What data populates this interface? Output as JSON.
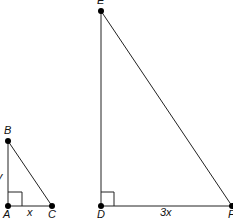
{
  "diagram": {
    "type": "similar-right-triangles",
    "triangles": [
      {
        "name": "ABC",
        "vertices": {
          "A": {
            "label": "A",
            "x": 8,
            "y": 206
          },
          "B": {
            "label": "B",
            "x": 8,
            "y": 141
          },
          "C": {
            "label": "C",
            "x": 52,
            "y": 206
          }
        },
        "right_angle_at": "A",
        "side_labels": {
          "AB": "y",
          "AC": "x"
        }
      },
      {
        "name": "DEF",
        "vertices": {
          "D": {
            "label": "D",
            "x": 101,
            "y": 206
          },
          "E": {
            "label": "E",
            "x": 101,
            "y": 11
          },
          "F": {
            "label": "F",
            "x": 232,
            "y": 206
          }
        },
        "right_angle_at": "D",
        "side_labels": {
          "DF": "3x"
        }
      }
    ],
    "colors": {
      "line": "#222222",
      "point": "#000000",
      "text": "#111111"
    }
  }
}
